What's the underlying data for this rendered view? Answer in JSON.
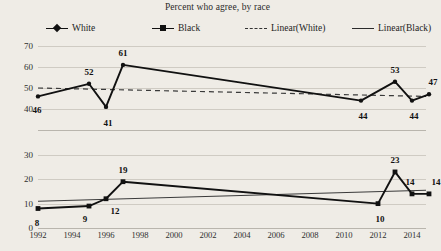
{
  "chart_title": "Percent who agree, by race",
  "legend": {
    "items": [
      {
        "label": "White",
        "marker": "diamond-marker",
        "line": "solid"
      },
      {
        "label": "Black",
        "marker": "square-marker",
        "line": "solid"
      },
      {
        "label": "Linear(White)",
        "marker": "none",
        "line": "dashed"
      },
      {
        "label": "Linear(Black)",
        "marker": "none",
        "line": "solid-thin"
      }
    ]
  },
  "chart_data": [
    {
      "type": "line",
      "title": "Percent who agree, by race",
      "panel": "top",
      "series_name": "White",
      "xlabel": "",
      "ylabel": "",
      "xlim": [
        1992,
        2015
      ],
      "ylim": [
        30,
        70
      ],
      "yticks": [
        70,
        60,
        50,
        40
      ],
      "grid": true,
      "legend_position": "top",
      "x": [
        1992,
        1995,
        1996,
        1997,
        2011,
        2013,
        2014,
        2015
      ],
      "values": [
        46,
        52,
        41,
        61,
        44,
        53,
        44,
        47
      ],
      "point_labels": [
        "46",
        "52",
        "41",
        "61",
        "44",
        "53",
        "44",
        "47"
      ],
      "trendline": {
        "name": "Linear(White)",
        "style": "dashed",
        "start": 50.0,
        "end": 46.0
      }
    },
    {
      "type": "line",
      "panel": "bottom",
      "series_name": "Black",
      "xlabel": "",
      "ylabel": "",
      "xlim": [
        1992,
        2015
      ],
      "ylim": [
        0,
        32
      ],
      "yticks": [
        30,
        20,
        10,
        0
      ],
      "grid": true,
      "x": [
        1992,
        1995,
        1996,
        1997,
        2012,
        2013,
        2014,
        2015
      ],
      "values": [
        8,
        9,
        12,
        19,
        10,
        23,
        14,
        14
      ],
      "point_labels": [
        "8",
        "9",
        "12",
        "19",
        "10",
        "23",
        "14",
        "14"
      ],
      "trendline": {
        "name": "Linear(Black)",
        "style": "solid-thin",
        "start": 11.0,
        "end": 15.5
      }
    }
  ],
  "xaxis": {
    "ticks": [
      "1992",
      "1994",
      "1996",
      "1998",
      "2000",
      "2002",
      "2004",
      "2006",
      "2008",
      "2010",
      "2012",
      "2014"
    ],
    "tick_values": [
      1992,
      1994,
      1996,
      1998,
      2000,
      2002,
      2004,
      2006,
      2008,
      2010,
      2012,
      2014
    ]
  },
  "colors": {
    "background": "#efece6",
    "series": "#111111",
    "grid": "#cfcbc3",
    "text": "#1a1a1a"
  }
}
